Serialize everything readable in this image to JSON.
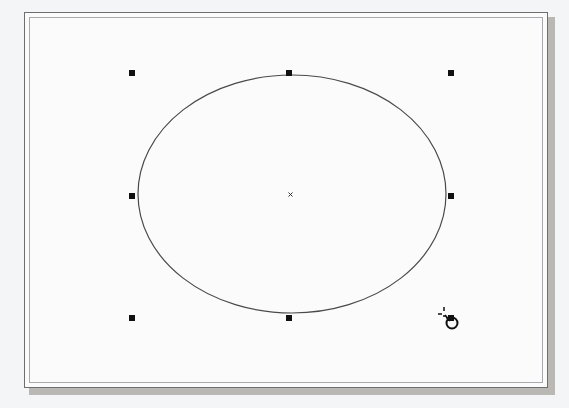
{
  "canvas": {
    "background_color": "#f4f5f7",
    "page_color": "#fbfbfc",
    "shadow_color": "#b9b8b4"
  },
  "shape": {
    "type": "ellipse",
    "center": [
      292,
      194
    ],
    "rx": 154,
    "ry": 119,
    "stroke_color": "#4a4a4a"
  },
  "selection": {
    "handle_color": "#111111",
    "handles": [
      {
        "name": "top-left",
        "x": 132,
        "y": 73
      },
      {
        "name": "top-middle",
        "x": 289,
        "y": 73
      },
      {
        "name": "top-right",
        "x": 451,
        "y": 73
      },
      {
        "name": "middle-left",
        "x": 132,
        "y": 196
      },
      {
        "name": "middle-right",
        "x": 451,
        "y": 196
      },
      {
        "name": "bottom-left",
        "x": 132,
        "y": 318
      },
      {
        "name": "bottom-middle",
        "x": 289,
        "y": 318
      },
      {
        "name": "bottom-right",
        "x": 451,
        "y": 318
      }
    ],
    "center_marker": "×"
  },
  "cursor": {
    "icon": "rotate-cursor-icon"
  }
}
